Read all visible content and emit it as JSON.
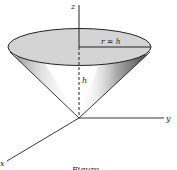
{
  "figure": {
    "labels": {
      "z_axis": "z",
      "y_axis": "y",
      "x_axis": "x",
      "radius": "r = h",
      "height": "h"
    },
    "caption": "Figure"
  },
  "colors": {
    "disk_fill": "#d4d4d4",
    "stroke": "#222222",
    "shade": "#666666"
  }
}
